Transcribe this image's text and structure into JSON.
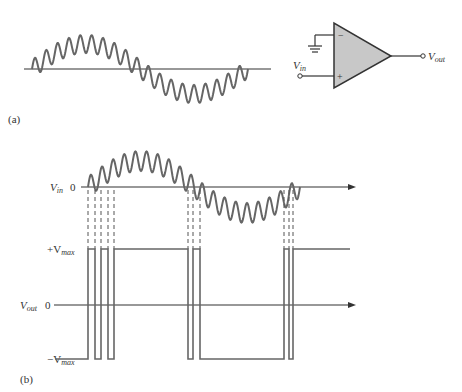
{
  "panel_a": {
    "label": "(a)",
    "opamp": {
      "inverting_symbol": "−",
      "noninverting_symbol": "+",
      "input_label": "V",
      "input_sub": "in",
      "output_label": "V",
      "output_sub": "out"
    }
  },
  "panel_b": {
    "label": "(b)",
    "vin_axis": {
      "label": "V",
      "sub": "in",
      "zero": "0"
    },
    "vout_axis": {
      "label": "V",
      "sub": "out",
      "zero": "0"
    },
    "pos_level": {
      "label": "+V",
      "sub": "max"
    },
    "neg_level": {
      "label": "−V",
      "sub": "max"
    }
  },
  "colors": {
    "wave": "#666666",
    "axis": "#333333",
    "opamp_fill": "#c8c8c8",
    "text": "#333333"
  }
}
